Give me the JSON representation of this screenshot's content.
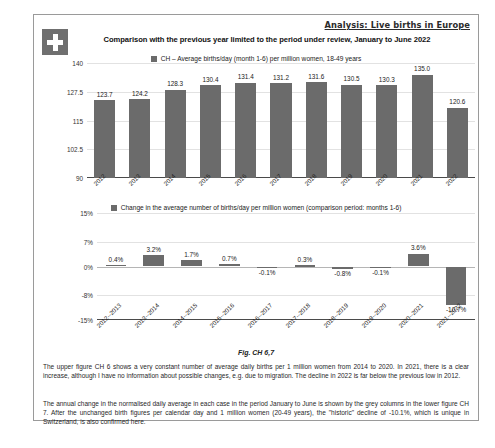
{
  "header": {
    "analysis_label": "Analysis: Live births in Europe",
    "flag_icon": "swiss-flag-icon",
    "title": "Comparison with the previous year limited to the period under review, January to June 2022"
  },
  "figure_caption": "Fig. CH 6,7",
  "body": {
    "paragraph_1": "The upper figure CH 6 shows a very constant number of average daily births per 1 million women from 2014 to 2020. In 2021, there is a clear increase, although I have no information about possible changes, e.g. due to migration. The decline in 2022 is far below the previous low in 2012.",
    "paragraph_2": "The annual change in the normalised daily average in each case in the period January to June is shown by the grey columns in the lower figure CH 7. After the unchanged birth figures per calendar day and 1 million women (20-49 years), the \"historic\" decline of -10.1%, which is unique in Switzerland, is also confirmed here."
  },
  "colors": {
    "bar": "#6b6b6b",
    "grid": "#e2e2e2",
    "axis": "#4a4a4a",
    "frame": "#9a9a9a"
  },
  "chart_data": [
    {
      "type": "bar",
      "id": "CH6",
      "title": "CH – Average births/day (month 1-6) per million women, 18-49 years",
      "legend": [
        "CH – Average births/day (month 1-6) per million women, 18-49 years"
      ],
      "legend_position": "top-center",
      "grid": true,
      "xlabel": "",
      "ylabel": "",
      "ylim": [
        90,
        140
      ],
      "yticks": [
        90,
        102.5,
        115,
        127.5,
        140
      ],
      "ytick_labels": [
        "90",
        "102.5",
        "115",
        "127.5",
        "140"
      ],
      "categories": [
        "2012",
        "2013",
        "2014",
        "2015",
        "2016",
        "2017",
        "2018",
        "2019",
        "2020",
        "2021",
        "2022"
      ],
      "values": [
        123.7,
        124.2,
        128.3,
        130.4,
        131.4,
        131.2,
        131.6,
        130.5,
        130.3,
        135.0,
        120.6
      ],
      "value_labels": [
        "123.7",
        "124.2",
        "128.3",
        "130.4",
        "131.4",
        "131.2",
        "131.6",
        "130.5",
        "130.3",
        "135.0",
        "120.6"
      ]
    },
    {
      "type": "bar",
      "id": "CH7",
      "title": "Change in the average number of births/day per million women (comparison period: months 1-6)",
      "legend": [
        "Change in the average number of births/day per million women (comparison period: months 1-6)"
      ],
      "legend_position": "top-center",
      "grid": true,
      "xlabel": "",
      "ylabel": "",
      "ylim": [
        -15,
        15
      ],
      "yticks": [
        -15,
        -8,
        0,
        7,
        15
      ],
      "ytick_labels": [
        "-15%",
        "-8%",
        "0%",
        "7%",
        "15%"
      ],
      "categories": [
        "2012--2013",
        "2013--2014",
        "2014--2015",
        "2015--2016",
        "2016--2017",
        "2017--2018",
        "2018--2019",
        "2019--2020",
        "2020--2021",
        "2021--2022"
      ],
      "values": [
        0.4,
        3.2,
        1.7,
        0.7,
        -0.1,
        0.3,
        -0.8,
        -0.1,
        3.6,
        -10.7
      ],
      "value_labels": [
        "0.4%",
        "3.2%",
        "1.7%",
        "0.7%",
        "-0.1%",
        "0.3%",
        "-0.8%",
        "-0.1%",
        "3.6%",
        "-10.7%"
      ]
    }
  ]
}
